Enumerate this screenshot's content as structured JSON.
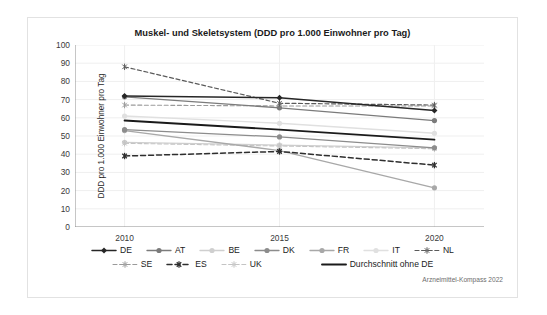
{
  "card": {
    "source_note": "Arzneimittel-Kompass 2022"
  },
  "chart_data": {
    "type": "line",
    "title": "Muskel- und Skeletsystem (DDD pro 1.000 Einwohner pro Tag)",
    "xlabel": "",
    "ylabel": "DDD pro 1.000 Einwohner pro Tag",
    "x": [
      2010,
      2015,
      2020
    ],
    "xticklabels": [
      "2010",
      "2015",
      "2020"
    ],
    "yticklabels": [
      "0",
      "10",
      "20",
      "30",
      "40",
      "50",
      "60",
      "70",
      "80",
      "90",
      "100"
    ],
    "ylim": [
      0,
      100
    ],
    "ytick_step": 10,
    "grid": true,
    "legend_position": "bottom",
    "series": [
      {
        "name": "DE",
        "values": [
          72.0,
          71.0,
          64.0
        ],
        "color": "#262626",
        "style": "solid",
        "marker": "diamond",
        "width": 1.5
      },
      {
        "name": "AT",
        "values": [
          71.5,
          65.5,
          58.5
        ],
        "color": "#7b7b7b",
        "style": "solid",
        "marker": "circle",
        "width": 1.3
      },
      {
        "name": "BE",
        "values": [
          46.5,
          45.0,
          43.5
        ],
        "color": "#cfcfcf",
        "style": "solid",
        "marker": "circle",
        "width": 1.3
      },
      {
        "name": "DK",
        "values": [
          53.5,
          49.5,
          43.5
        ],
        "color": "#8c8c8c",
        "style": "solid",
        "marker": "circle",
        "width": 1.3
      },
      {
        "name": "FR",
        "values": [
          53.0,
          42.0,
          21.5
        ],
        "color": "#a8a8a8",
        "style": "solid",
        "marker": "circle",
        "width": 1.3
      },
      {
        "name": "IT",
        "values": [
          61.0,
          57.0,
          51.5
        ],
        "color": "#e0e0e0",
        "style": "solid",
        "marker": "circle",
        "width": 1.3
      },
      {
        "name": "NL",
        "values": [
          88.0,
          68.0,
          67.0
        ],
        "color": "#5a5a5a",
        "style": "dashed",
        "marker": "asterisk",
        "width": 1.2
      },
      {
        "name": "SE",
        "values": [
          67.0,
          66.5,
          66.5
        ],
        "color": "#9a9a9a",
        "style": "dashed",
        "marker": "asterisk",
        "width": 1.1
      },
      {
        "name": "ES",
        "values": [
          39.0,
          41.5,
          34.0
        ],
        "color": "#2e2e2e",
        "style": "dashed",
        "marker": "asterisk",
        "width": 1.5
      },
      {
        "name": "UK",
        "values": [
          46.0,
          44.5,
          43.0
        ],
        "color": "#c4c4c4",
        "style": "dashed",
        "marker": "asterisk",
        "width": 1.1
      },
      {
        "name": "Durchschnitt ohne DE",
        "values": [
          58.5,
          53.5,
          48.0
        ],
        "color": "#1a1a1a",
        "style": "solid",
        "marker": "none",
        "width": 1.9
      }
    ]
  },
  "legend": {
    "row1": [
      "DE",
      "AT",
      "BE",
      "DK",
      "FR",
      "IT",
      "NL"
    ],
    "row2": [
      "SE",
      "ES",
      "UK",
      "Durchschnitt ohne DE"
    ]
  }
}
